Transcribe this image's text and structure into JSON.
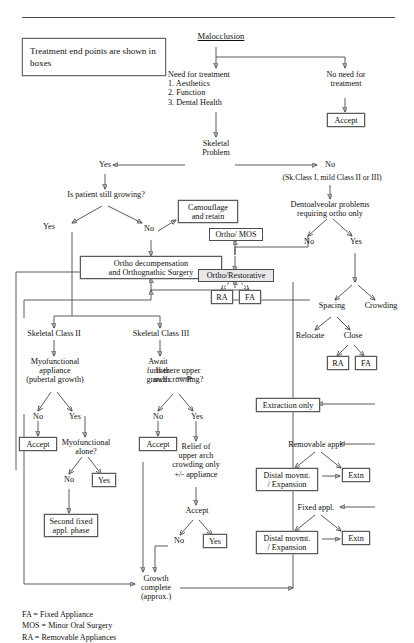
{
  "document": {
    "title": "Orthodontic treatment planning flowchart",
    "top_rule": true
  },
  "info_box": {
    "text": "Treatment end points are shown in boxes"
  },
  "legend": {
    "text": "FA = Fixed Appliance\nMOS = Minor Oral Surgery\nRA = Removable Appliances"
  },
  "nodes": {
    "malocclusion": "Malocclusion",
    "need_for_treatment": "Need for treatment\n1. Aesthetics\n2. Function\n3. Dental Health",
    "no_need_for_treatment": "No need for\ntreatment",
    "accept_no_need": "Accept",
    "skeletal_problem": "Skeletal\nProblem",
    "yes_skeletal": "Yes",
    "no_skeletal": "No",
    "sk_class_note": "(Sk.Class I, mild Class II or III)",
    "is_patient_growing": "Is patient still growing?",
    "growing_yes": "Yes",
    "growing_no": "No",
    "camouflage_retain": "Camouflage\nand retain",
    "ortho_decompensation": "Ortho decompensation\nand Orthognathic Surgery",
    "dentoalveolar_problems": "Dentoalveolar problems\nrequiring ortho only",
    "dento_no": "No",
    "dento_yes": "Yes",
    "ortho_mos": "Ortho/ MOS",
    "ortho_restorative": "Ortho/Restorative",
    "ra_restorative": "RA",
    "fa_restorative": "FA",
    "spacing": "Spacing",
    "crowding": "Crowding",
    "relocate": "Relocate",
    "close": "Close",
    "ra_close": "RA",
    "fa_close": "FA",
    "skeletal_class_ii": "Skeletal Class II",
    "skeletal_class_iii": "Skeletal Class III",
    "myofunctional_appliance": "Myofunctional\nappliance\n(pubertal growth)",
    "await_further_growth": "Await\nfurther\ngrowth",
    "myo_no": "No",
    "myo_yes": "Yes",
    "accept_myo": "Accept",
    "myofunctional_alone": "Myofunctional\nalone?",
    "alone_no": "No",
    "alone_yes": "Yes",
    "second_fixed_phase": "Second fixed\nappl. phase",
    "upper_arch_crowding": "Is there upper\narch crowding?",
    "arch_no": "No",
    "arch_yes": "Yes",
    "accept_arch": "Accept",
    "relief_upper_arch": "Relief of\nupper arch\ncrowding only\n+/- appliance",
    "accept_relief": "Accept",
    "relief_no": "No",
    "relief_yes": "Yes",
    "extraction_only": "Extraction only",
    "removable_appl": "Removable appl.",
    "distal_removable": "Distal movmt.\n/ Expansion",
    "extn_removable": "Extn",
    "fixed_appl": "Fixed appl.",
    "distal_fixed": "Distal movmt.\n/ Expansion",
    "extn_fixed": "Extn",
    "growth_complete": "Growth\ncomplete\n(approx.)"
  },
  "colors": {
    "ink": "#111111",
    "wire": "#4a4a4a",
    "box_border": "#5a5a5a",
    "background": "#ffffff"
  }
}
